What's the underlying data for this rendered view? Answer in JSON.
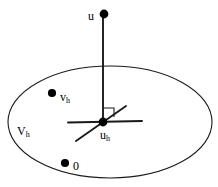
{
  "figure": {
    "type": "geometry-diagram",
    "name": "galerkin-orthogonality",
    "width": 218,
    "height": 187,
    "background_color": "#ffffff",
    "stroke_color": "#1a1a1a",
    "point_color": "#000000"
  },
  "labels": {
    "u": {
      "base": "u",
      "sub": ""
    },
    "vh": {
      "base": "v",
      "sub": "h"
    },
    "Vh": {
      "base": "V",
      "sub": "h"
    },
    "uh": {
      "base": "u",
      "sub": "h"
    },
    "zero": {
      "base": "0",
      "sub": ""
    }
  },
  "geometry": {
    "subspace_ellipse": {
      "cx": 110,
      "cy": 122,
      "rx": 102,
      "ry": 56
    },
    "point_u": {
      "x": 104,
      "y": 14,
      "r": 4.2
    },
    "point_uh": {
      "x": 103,
      "y": 122,
      "r": 4.2
    },
    "point_vh": {
      "x": 52,
      "y": 93,
      "r": 4.0
    },
    "point_zero": {
      "x": 65,
      "y": 163,
      "r": 4.0
    },
    "vertical_segment": {
      "x1": 103,
      "y1": 14,
      "x2": 103,
      "y2": 124
    },
    "horizontal_segment": {
      "x1": 68,
      "y1": 122,
      "x2": 142,
      "y2": 121
    },
    "diagonal_segment": {
      "x1": 76,
      "y1": 141,
      "x2": 126,
      "y2": 106
    },
    "right_angle_marker": {
      "p1x": 103,
      "p1y": 108,
      "p2x": 114,
      "p2y": 108,
      "p3x": 114,
      "p3y": 117
    }
  }
}
